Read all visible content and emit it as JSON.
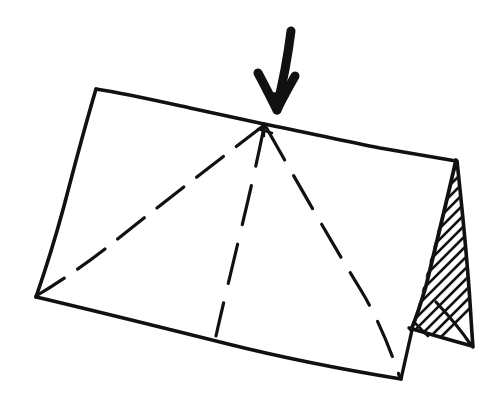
{
  "canvas": {
    "width": 498,
    "height": 408,
    "background_color": "#ffffff",
    "ink_color": "#111111"
  },
  "drawing": {
    "title": "Hand-drawn A-frame tent / folded card sketch",
    "style": "pen sketch, freehand",
    "elements": [
      {
        "name": "front-panel",
        "kind": "quadrilateral-outline",
        "stroke": "solid"
      },
      {
        "name": "ridge-line",
        "kind": "line",
        "stroke": "solid"
      },
      {
        "name": "crease-left",
        "kind": "line",
        "stroke": "dashed"
      },
      {
        "name": "crease-center",
        "kind": "line",
        "stroke": "dashed"
      },
      {
        "name": "crease-right",
        "kind": "line",
        "stroke": "dashed"
      },
      {
        "name": "end-panel-triangle",
        "kind": "triangle",
        "stroke": "solid",
        "fill": "diagonal-hatch"
      },
      {
        "name": "force-arrow",
        "kind": "arrow",
        "direction": "down"
      }
    ]
  },
  "geometry": {
    "front_panel_outline": "M 96,89 L 264,124 L 456,160 L 473,347 L 401,379 L 36,297 Z",
    "top_edge_left": "M 96,89 C 150,99 210,113 264,124",
    "top_edge_right": "M 264,124 C 330,137 398,150 456,160",
    "left_edge": "M 96,89 C 80,160 58,232 36,297",
    "bottom_edge": "M 36,297 C 150,322 290,354 401,379",
    "apex_point": [
      264,
      124
    ],
    "triangle_vertices": [
      [
        456,
        160
      ],
      [
        412,
        329
      ],
      [
        473,
        347
      ]
    ],
    "triangle_inner_line": "M 436,303 L 471,345",
    "triangle_base_line": "M 409,327 L 470,345",
    "arrow_shaft": "M 291,31 L 276,105",
    "arrow_head_left": "M 259,74 L 277,110",
    "arrow_head_right": "M 294,77 L 277,110",
    "crease_left_path": "M 263,126 L 36,296",
    "crease_center_path": "M 264,127 L 216,335",
    "crease_right_path": "M 266,127 L 400,377"
  },
  "strokes": {
    "outline_width": 3.4,
    "dash_width": 3.2,
    "hatch_width": 2.6,
    "arrow_shaft_width": 9,
    "arrow_head_width": 9,
    "dash_pattern_left": "34 16",
    "dash_pattern_center": "40 20",
    "dash_pattern_right": "38 18"
  },
  "hatching": {
    "name": "diagonal-hatch",
    "direction": "lower-left-to-upper-right",
    "line_count": 16,
    "spacing_px": 11
  },
  "labels": {
    "none_visible": ""
  }
}
